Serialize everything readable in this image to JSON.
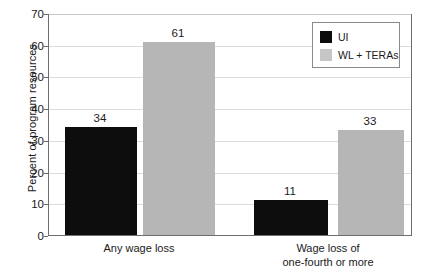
{
  "chart_data": {
    "type": "bar",
    "title": "",
    "subtitle": "",
    "xlabel": "",
    "ylabel": "Percent of program resources",
    "ylim": [
      0,
      70
    ],
    "ytick_step": 10,
    "yticks": [
      "0",
      "10",
      "20",
      "30",
      "40",
      "50",
      "60",
      "70"
    ],
    "grid": true,
    "legend_position": "top-right",
    "categories": [
      "Any wage loss",
      "Wage loss of\none-fourth or more"
    ],
    "series": [
      {
        "name": "UI",
        "color": "#0d0d0d",
        "values": [
          34,
          61
        ]
      },
      {
        "name": "WL + TERAs",
        "color": "#b6b6b6",
        "values": [
          11,
          33
        ]
      }
    ],
    "bars": [
      {
        "category_index": 0,
        "series": "UI",
        "value": 34,
        "label": "34"
      },
      {
        "category_index": 0,
        "series": "WL + TERAs",
        "value": 61,
        "label": "61"
      },
      {
        "category_index": 1,
        "series": "UI",
        "value": 11,
        "label": "11"
      },
      {
        "category_index": 1,
        "series": "WL + TERAs",
        "value": 33,
        "label": "33"
      }
    ]
  },
  "legend": {
    "entries": [
      {
        "label": "UI",
        "swatch": "black"
      },
      {
        "label": "WL + TERAs",
        "swatch": "gray"
      }
    ]
  },
  "axis": {
    "y_title": "Percent of program resources"
  },
  "colors": {
    "series_ui": "#0d0d0d",
    "series_wl": "#b6b6b6",
    "gridline": "#dcdcdc",
    "axis": "#6e6e6e",
    "text": "#1a1a1a",
    "background": "#ffffff"
  }
}
